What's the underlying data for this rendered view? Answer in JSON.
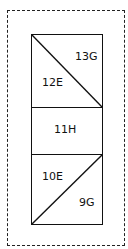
{
  "diagram": {
    "cells": [
      {
        "id": "top",
        "labels": [
          "13G",
          "12E"
        ],
        "diagonal": "top-left to bottom-right"
      },
      {
        "id": "middle",
        "labels": [
          "11H"
        ]
      },
      {
        "id": "bottom",
        "labels": [
          "10E",
          "9G"
        ],
        "diagonal": "bottom-left to top-right"
      }
    ],
    "top": {
      "upper_label": "13G",
      "lower_label": "12E"
    },
    "middle": {
      "label": "11H"
    },
    "bottom": {
      "upper_label": "10E",
      "lower_label": "9G"
    },
    "colors": {
      "stroke": "#111111",
      "background": "#ffffff"
    }
  }
}
